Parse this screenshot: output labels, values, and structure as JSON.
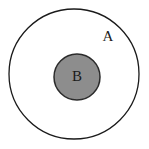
{
  "diagram": {
    "type": "euler-subset-diagram",
    "canvas": {
      "width": 149,
      "height": 149,
      "background_color": "#ffffff"
    },
    "sets": [
      {
        "id": "outer-set",
        "label": "A",
        "shape": "circle",
        "center_x": 74,
        "center_y": 74,
        "radius": 65,
        "fill_color": "#ffffff",
        "stroke_color": "#1a1a1a",
        "stroke_width": 1.3,
        "label_x": 108,
        "label_y": 38
      },
      {
        "id": "inner-set",
        "label": "B",
        "shape": "circle",
        "center_x": 77,
        "center_y": 77,
        "radius": 23,
        "fill_color": "#8d8d8d",
        "stroke_color": "#2b2b2b",
        "stroke_width": 1.5,
        "label_x": 77,
        "label_y": 78
      }
    ]
  }
}
